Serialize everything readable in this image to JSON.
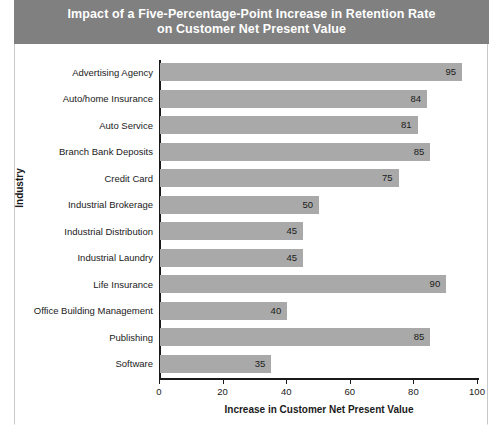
{
  "chart_data": {
    "type": "bar",
    "orientation": "horizontal",
    "title": "Impact of a Five-Percentage-Point Increase in Retention Rate\non Customer Net Present Value",
    "xlabel": "Increase in Customer Net Present Value",
    "ylabel": "Industry",
    "xlim": [
      0,
      100
    ],
    "xticks": [
      0,
      20,
      40,
      60,
      80,
      100
    ],
    "grid": false,
    "legend": null,
    "categories": [
      "Advertising Agency",
      "Auto/home Insurance",
      "Auto Service",
      "Branch Bank Deposits",
      "Credit Card",
      "Industrial Brokerage",
      "Industrial Distribution",
      "Industrial Laundry",
      "Life Insurance",
      "Office Building Management",
      "Publishing",
      "Software"
    ],
    "values": [
      95,
      84,
      81,
      85,
      75,
      50,
      45,
      45,
      90,
      40,
      85,
      35
    ],
    "bar_color": "#a9a9a9",
    "title_background": "#808080",
    "title_color": "#ffffff"
  }
}
